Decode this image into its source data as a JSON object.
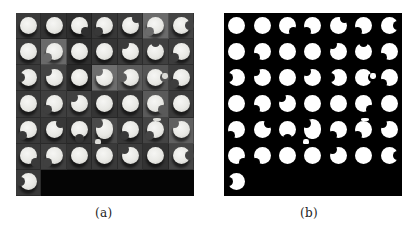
{
  "figure": {
    "panels": [
      {
        "id": "a",
        "caption": "(a)",
        "kind": "grayscale-photo-grid",
        "background": "#050505"
      },
      {
        "id": "b",
        "caption": "(b)",
        "kind": "binary-mask-grid",
        "background": "#000000",
        "foreground": "#ffffff"
      }
    ],
    "grid": {
      "columns": 7,
      "rows": 7,
      "cell_count": 43
    },
    "cells": [
      {
        "r": 0,
        "c": 0,
        "tile": "#3a3a3a",
        "notch": null
      },
      {
        "r": 0,
        "c": 1,
        "tile": "#333333",
        "notch": null
      },
      {
        "r": 0,
        "c": 2,
        "tile": "#2e2e2e",
        "notch": "br"
      },
      {
        "r": 0,
        "c": 3,
        "tile": "#383838",
        "notch": "bl"
      },
      {
        "r": 0,
        "c": 4,
        "tile": "#3c3c3c",
        "notch": "tr"
      },
      {
        "r": 0,
        "c": 5,
        "tile": "#6b6b6b",
        "notch": "bl"
      },
      {
        "r": 0,
        "c": 6,
        "tile": "#444444",
        "notch": "r"
      },
      {
        "r": 1,
        "c": 0,
        "tile": "#3b3b3b",
        "notch": null
      },
      {
        "r": 1,
        "c": 1,
        "tile": "#6a6a6a",
        "notch": "bl"
      },
      {
        "r": 1,
        "c": 2,
        "tile": "#2f2f2f",
        "notch": null
      },
      {
        "r": 1,
        "c": 3,
        "tile": "#353535",
        "notch": null
      },
      {
        "r": 1,
        "c": 4,
        "tile": "#3a3a3a",
        "notch": "tl"
      },
      {
        "r": 1,
        "c": 5,
        "tile": "#404040",
        "notch": "t"
      },
      {
        "r": 1,
        "c": 6,
        "tile": "#3d3d3d",
        "notch": "bl"
      },
      {
        "r": 2,
        "c": 0,
        "tile": "#3a3a3a",
        "notch": "l"
      },
      {
        "r": 2,
        "c": 1,
        "tile": "#444444",
        "notch": "tl"
      },
      {
        "r": 2,
        "c": 2,
        "tile": "#2a2a2a",
        "notch": null
      },
      {
        "r": 2,
        "c": 3,
        "tile": "#6e6e6e",
        "notch": "tl"
      },
      {
        "r": 2,
        "c": 4,
        "tile": "#5c5c5c",
        "notch": "l"
      },
      {
        "r": 2,
        "c": 5,
        "tile": "#555555",
        "notch": "r",
        "chip": "r"
      },
      {
        "r": 2,
        "c": 6,
        "tile": "#3d3d3d",
        "notch": "bl"
      },
      {
        "r": 3,
        "c": 0,
        "tile": "#3a3a3a",
        "notch": null
      },
      {
        "r": 3,
        "c": 1,
        "tile": "#3f3f3f",
        "notch": "bl"
      },
      {
        "r": 3,
        "c": 2,
        "tile": "#404040",
        "notch": "tl"
      },
      {
        "r": 3,
        "c": 3,
        "tile": "#353535",
        "notch": null
      },
      {
        "r": 3,
        "c": 4,
        "tile": "#383838",
        "notch": null
      },
      {
        "r": 3,
        "c": 5,
        "tile": "#5a5a5a",
        "notch": "br"
      },
      {
        "r": 3,
        "c": 6,
        "tile": "#3b3b3b",
        "notch": null
      },
      {
        "r": 4,
        "c": 0,
        "tile": "#3a3a3a",
        "notch": "bl"
      },
      {
        "r": 4,
        "c": 1,
        "tile": "#383838",
        "notch": "tr"
      },
      {
        "r": 4,
        "c": 2,
        "tile": "#333333",
        "notch": "b"
      },
      {
        "r": 4,
        "c": 3,
        "tile": "#4a4a4a",
        "notch": "tl",
        "chip": "bl",
        "tall": true
      },
      {
        "r": 4,
        "c": 4,
        "tile": "#383838",
        "notch": "bl"
      },
      {
        "r": 4,
        "c": 5,
        "tile": "#444444",
        "notch": "bl",
        "chip": "t"
      },
      {
        "r": 4,
        "c": 6,
        "tile": "#606060",
        "notch": "tl"
      },
      {
        "r": 5,
        "c": 0,
        "tile": "#3a3a3a",
        "notch": "br"
      },
      {
        "r": 5,
        "c": 1,
        "tile": "#404040",
        "notch": "bl"
      },
      {
        "r": 5,
        "c": 2,
        "tile": "#353535",
        "notch": null
      },
      {
        "r": 5,
        "c": 3,
        "tile": "#3a3a3a",
        "notch": null
      },
      {
        "r": 5,
        "c": 4,
        "tile": "#3c3c3c",
        "notch": "tl"
      },
      {
        "r": 5,
        "c": 5,
        "tile": "#333333",
        "notch": null
      },
      {
        "r": 5,
        "c": 6,
        "tile": "#454545",
        "notch": "r"
      },
      {
        "r": 6,
        "c": 0,
        "tile": "#3a3a3a",
        "notch": "l"
      }
    ],
    "empty_region_color": "#050505"
  }
}
